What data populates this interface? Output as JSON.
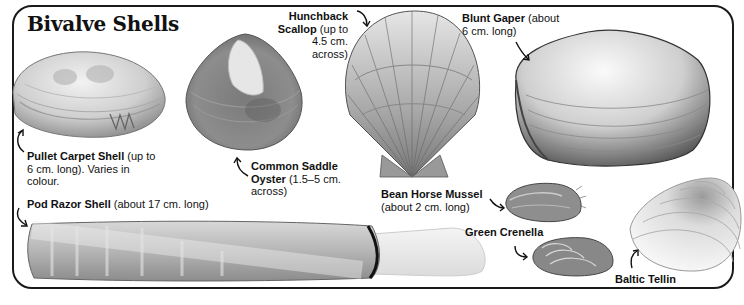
{
  "title": "Bivalve Shells",
  "shells": [
    {
      "id": "pullet-carpet-shell",
      "name": "Pullet Carpet Shell",
      "desc_lines": [
        " (up to",
        "6 cm. long). Varies in",
        "colour."
      ]
    },
    {
      "id": "common-saddle-oyster",
      "name_lines": [
        "Common Saddle",
        "Oyster"
      ],
      "desc_lines": [
        " (1.5–5 cm.",
        "across)"
      ]
    },
    {
      "id": "hunchback-scallop",
      "name_lines": [
        "Hunchback",
        "Scallop"
      ],
      "desc_lines": [
        " (up to",
        "4.5 cm.",
        "across)"
      ]
    },
    {
      "id": "blunt-gaper",
      "name": "Blunt Gaper",
      "desc_lines": [
        " (about",
        "6 cm. long)"
      ]
    },
    {
      "id": "pod-razor-shell",
      "name": "Pod Razor Shell",
      "desc": " (about 17 cm. long)"
    },
    {
      "id": "bean-horse-mussel",
      "name": "Bean Horse Mussel",
      "desc": "(about 2 cm. long)"
    },
    {
      "id": "green-crenella",
      "name": "Green Crenella"
    },
    {
      "id": "baltic-tellin",
      "name": "Baltic Tellin"
    }
  ],
  "colors": {
    "frame": "#1a1a1a",
    "text": "#111111",
    "background": "#ffffff"
  }
}
